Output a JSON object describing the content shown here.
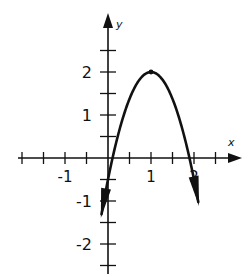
{
  "graph": {
    "description": "Hand-drawn graph of a downward-opening parabola with vertex at (1, 2)",
    "x_axis_label": "x",
    "y_axis_label": "y",
    "x_tick_labels": [
      {
        "value": -1,
        "text": "-1"
      },
      {
        "value": 1,
        "text": "1"
      },
      {
        "value": 2,
        "text": "2"
      }
    ],
    "y_tick_labels": [
      {
        "value": 2,
        "text": "2"
      },
      {
        "value": 1,
        "text": "1"
      },
      {
        "value": -1,
        "text": "-1"
      },
      {
        "value": -2,
        "text": "-2"
      }
    ],
    "tick_step": 0.5,
    "x_range": [
      -2,
      3
    ],
    "y_range": [
      -2.5,
      3.3
    ],
    "curve": {
      "type": "parabola",
      "vertex": [
        1,
        2
      ],
      "a": -2.5,
      "x_intercepts": [
        0.11,
        1.89
      ],
      "domain": [
        -0.15,
        2.1
      ],
      "ends_with_arrows": true
    },
    "ink_color": "#111111"
  }
}
